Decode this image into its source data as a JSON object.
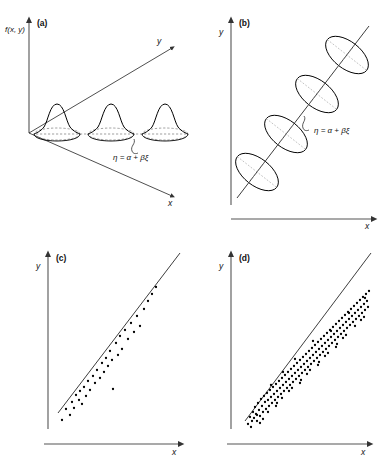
{
  "figure": {
    "background_color": "#ffffff",
    "ink_color": "#000000",
    "axis_color": "#555555"
  },
  "panels": [
    {
      "tag": "(a)",
      "name": "conditional-distributions-3d",
      "vertical_axis_label": "f(x, y)",
      "depth_axis_label": "y",
      "horizontal_axis_label": "x",
      "annotation": "η = α + βξ",
      "bell_count": 3
    },
    {
      "tag": "(b)",
      "name": "contour-ellipses",
      "vertical_axis_label": "y",
      "horizontal_axis_label": "x",
      "annotation": "η = α + βξ",
      "ellipse_count": 4
    },
    {
      "tag": "(c)",
      "name": "sparse-scatter",
      "vertical_axis_label": "y",
      "horizontal_axis_label": "x",
      "point_count": 38
    },
    {
      "tag": "(d)",
      "name": "dense-scatter",
      "vertical_axis_label": "y",
      "horizontal_axis_label": "x",
      "point_count": 152
    }
  ],
  "chart_data": [
    {
      "type": "line",
      "panel": "(a)",
      "title": "",
      "xlabel": "x",
      "ylabel": "f(x, y)",
      "zlabel": "y",
      "description": "Three identical normal density bells sitting on elliptical bases along the regression ray in the x-y plane",
      "annotation": "η = α + βξ",
      "bells": [
        {
          "cx": 57,
          "base_y": 131,
          "height": 34,
          "half_width": 22
        },
        {
          "cx": 111,
          "base_y": 131,
          "height": 34,
          "half_width": 22
        },
        {
          "cx": 165,
          "base_y": 131,
          "height": 34,
          "half_width": 22
        }
      ],
      "rays": [
        {
          "x1": 29,
          "y1": 133,
          "x2": 176,
          "y2": 46
        },
        {
          "x1": 29,
          "y1": 133,
          "x2": 176,
          "y2": 197
        }
      ],
      "grid": false,
      "legend": "none"
    },
    {
      "type": "scatter",
      "panel": "(b)",
      "title": "",
      "xlabel": "x",
      "ylabel": "y",
      "description": "Four tilted concentration ellipses strung along the straight regression line",
      "annotation": "η = α + βξ",
      "line": {
        "x1": 40,
        "y1": 196,
        "x2": 172,
        "y2": 28
      },
      "ellipses": [
        {
          "cx": 62,
          "cy": 169,
          "rx": 13,
          "ry": 24,
          "rotation": 38
        },
        {
          "cx": 90,
          "cy": 133,
          "rx": 13,
          "ry": 24,
          "rotation": 38
        },
        {
          "cx": 122,
          "cy": 93,
          "rx": 13,
          "ry": 24,
          "rotation": 38
        },
        {
          "cx": 152,
          "cy": 55,
          "rx": 13,
          "ry": 24,
          "rotation": 38
        }
      ],
      "grid": false,
      "legend": "none"
    },
    {
      "type": "scatter",
      "panel": "(c)",
      "title": "",
      "xlabel": "x",
      "ylabel": "y",
      "description": "Sparse sample of about 38 observations scattered about the fitted regression line",
      "grid": false,
      "legend": "none",
      "line": {
        "x1": 58,
        "y1": 182,
        "x2": 180,
        "y2": 22
      },
      "points": [
        [
          62,
          189
        ],
        [
          66,
          178
        ],
        [
          70,
          184
        ],
        [
          72,
          171
        ],
        [
          74,
          177
        ],
        [
          76,
          164
        ],
        [
          79,
          169
        ],
        [
          80,
          160
        ],
        [
          82,
          173
        ],
        [
          84,
          156
        ],
        [
          86,
          165
        ],
        [
          88,
          150
        ],
        [
          90,
          159
        ],
        [
          93,
          145
        ],
        [
          95,
          152
        ],
        [
          97,
          139
        ],
        [
          100,
          147
        ],
        [
          102,
          132
        ],
        [
          104,
          141
        ],
        [
          106,
          127
        ],
        [
          108,
          135
        ],
        [
          110,
          120
        ],
        [
          112,
          129
        ],
        [
          113,
          158
        ],
        [
          116,
          112
        ],
        [
          118,
          124
        ],
        [
          120,
          105
        ],
        [
          122,
          118
        ],
        [
          125,
          99
        ],
        [
          128,
          108
        ],
        [
          131,
          92
        ],
        [
          134,
          101
        ],
        [
          137,
          85
        ],
        [
          140,
          95
        ],
        [
          144,
          78
        ],
        [
          148,
          70
        ],
        [
          152,
          63
        ],
        [
          156,
          56
        ]
      ]
    },
    {
      "type": "scatter",
      "panel": "(d)",
      "title": "",
      "xlabel": "x",
      "ylabel": "y",
      "description": "Dense sample of about 152 observations clustered tightly about the same regression line, heaviest at both ends",
      "grid": false,
      "legend": "none",
      "line": {
        "x1": 52,
        "y1": 190,
        "x2": 178,
        "y2": 22
      },
      "points": [
        [
          55,
          193
        ],
        [
          57,
          186
        ],
        [
          59,
          190
        ],
        [
          60,
          181
        ],
        [
          61,
          187
        ],
        [
          62,
          176
        ],
        [
          63,
          183
        ],
        [
          64,
          190
        ],
        [
          65,
          172
        ],
        [
          66,
          179
        ],
        [
          67,
          185
        ],
        [
          68,
          168
        ],
        [
          69,
          175
        ],
        [
          70,
          181
        ],
        [
          71,
          165
        ],
        [
          72,
          171
        ],
        [
          73,
          178
        ],
        [
          74,
          162
        ],
        [
          75,
          169
        ],
        [
          76,
          175
        ],
        [
          77,
          159
        ],
        [
          78,
          166
        ],
        [
          79,
          172
        ],
        [
          80,
          156
        ],
        [
          81,
          163
        ],
        [
          82,
          169
        ],
        [
          83,
          153
        ],
        [
          84,
          160
        ],
        [
          85,
          166
        ],
        [
          86,
          150
        ],
        [
          87,
          157
        ],
        [
          88,
          163
        ],
        [
          89,
          147
        ],
        [
          90,
          154
        ],
        [
          91,
          160
        ],
        [
          92,
          144
        ],
        [
          93,
          151
        ],
        [
          94,
          157
        ],
        [
          95,
          141
        ],
        [
          96,
          148
        ],
        [
          97,
          154
        ],
        [
          98,
          138
        ],
        [
          99,
          145
        ],
        [
          100,
          151
        ],
        [
          101,
          135
        ],
        [
          102,
          142
        ],
        [
          103,
          148
        ],
        [
          104,
          132
        ],
        [
          105,
          139
        ],
        [
          106,
          145
        ],
        [
          107,
          129
        ],
        [
          108,
          136
        ],
        [
          109,
          142
        ],
        [
          110,
          126
        ],
        [
          111,
          133
        ],
        [
          112,
          139
        ],
        [
          113,
          123
        ],
        [
          114,
          130
        ],
        [
          115,
          136
        ],
        [
          116,
          120
        ],
        [
          117,
          127
        ],
        [
          118,
          133
        ],
        [
          119,
          117
        ],
        [
          120,
          124
        ],
        [
          121,
          130
        ],
        [
          122,
          114
        ],
        [
          123,
          121
        ],
        [
          124,
          127
        ],
        [
          125,
          111
        ],
        [
          126,
          118
        ],
        [
          127,
          124
        ],
        [
          128,
          108
        ],
        [
          129,
          115
        ],
        [
          130,
          121
        ],
        [
          131,
          105
        ],
        [
          132,
          112
        ],
        [
          133,
          118
        ],
        [
          134,
          102
        ],
        [
          135,
          109
        ],
        [
          136,
          115
        ],
        [
          137,
          99
        ],
        [
          138,
          106
        ],
        [
          139,
          112
        ],
        [
          140,
          96
        ],
        [
          141,
          103
        ],
        [
          142,
          109
        ],
        [
          143,
          93
        ],
        [
          144,
          100
        ],
        [
          145,
          106
        ],
        [
          146,
          90
        ],
        [
          147,
          97
        ],
        [
          148,
          103
        ],
        [
          149,
          87
        ],
        [
          150,
          94
        ],
        [
          151,
          100
        ],
        [
          152,
          84
        ],
        [
          153,
          91
        ],
        [
          154,
          97
        ],
        [
          155,
          81
        ],
        [
          156,
          88
        ],
        [
          157,
          94
        ],
        [
          158,
          78
        ],
        [
          159,
          85
        ],
        [
          160,
          91
        ],
        [
          161,
          75
        ],
        [
          162,
          82
        ],
        [
          163,
          88
        ],
        [
          164,
          72
        ],
        [
          165,
          79
        ],
        [
          166,
          85
        ],
        [
          167,
          69
        ],
        [
          168,
          76
        ],
        [
          169,
          82
        ],
        [
          170,
          66
        ],
        [
          171,
          73
        ],
        [
          172,
          79
        ],
        [
          173,
          63
        ],
        [
          174,
          70
        ],
        [
          175,
          76
        ],
        [
          176,
          60
        ],
        [
          58,
          196
        ],
        [
          64,
          184
        ],
        [
          70,
          188
        ],
        [
          78,
          154
        ],
        [
          84,
          172
        ],
        [
          90,
          141
        ],
        [
          96,
          160
        ],
        [
          102,
          128
        ],
        [
          108,
          149
        ],
        [
          114,
          143
        ],
        [
          120,
          110
        ],
        [
          126,
          131
        ],
        [
          132,
          125
        ],
        [
          138,
          100
        ],
        [
          144,
          113
        ],
        [
          150,
          107
        ],
        [
          156,
          82
        ],
        [
          162,
          95
        ],
        [
          168,
          89
        ],
        [
          172,
          67
        ],
        [
          67,
          192
        ],
        [
          75,
          181
        ],
        [
          83,
          175
        ],
        [
          99,
          157
        ],
        [
          117,
          139
        ],
        [
          135,
          122
        ],
        [
          153,
          104
        ],
        [
          171,
          86
        ],
        [
          89,
          167
        ],
        [
          107,
          152
        ],
        [
          125,
          134
        ],
        [
          143,
          116
        ]
      ]
    }
  ]
}
